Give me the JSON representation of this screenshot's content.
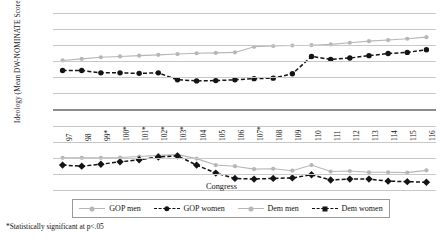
{
  "chart_data": {
    "type": "line",
    "title": "",
    "xlabel": "Congress",
    "ylabel": "Ideology (Mean DW-NOMINATE Score)",
    "ylim": [
      -0.5,
      0.6
    ],
    "yticks": [
      "0.6",
      "0.5",
      "0.4",
      "0.3",
      "0.2",
      "0.1",
      "0",
      "-0.1",
      "-0.2",
      "-0.3",
      "-0.4",
      "-0.5"
    ],
    "grid": true,
    "legend_position": "bottom",
    "categories": [
      "97",
      "98",
      "99*",
      "100*",
      "101*",
      "102*",
      "103*",
      "104",
      "105",
      "106",
      "107*",
      "108",
      "109",
      "110",
      "111",
      "112",
      "113",
      "114",
      "115",
      "116"
    ],
    "series": [
      {
        "name": "GOP men",
        "color": "#b6b6b6",
        "style": "solid",
        "marker": "circle",
        "values": [
          0.305,
          0.315,
          0.325,
          0.33,
          0.335,
          0.34,
          0.345,
          0.35,
          0.352,
          0.355,
          0.39,
          0.395,
          0.398,
          0.4,
          0.405,
          0.415,
          0.425,
          0.432,
          0.44,
          0.45
        ]
      },
      {
        "name": "GOP women",
        "color": "#141414",
        "style": "dashed",
        "marker": "circle",
        "values": [
          0.243,
          0.243,
          0.228,
          0.228,
          0.225,
          0.228,
          0.185,
          0.178,
          0.18,
          0.185,
          0.192,
          0.195,
          0.222,
          0.33,
          0.312,
          0.32,
          0.335,
          0.348,
          0.355,
          0.372
        ]
      },
      {
        "name": "Dem men",
        "color": "#b6b6b6",
        "style": "solid",
        "marker": "circle",
        "values": [
          -0.3,
          -0.3,
          -0.3,
          -0.298,
          -0.292,
          -0.285,
          -0.28,
          -0.305,
          -0.345,
          -0.352,
          -0.37,
          -0.368,
          -0.38,
          -0.345,
          -0.385,
          -0.382,
          -0.39,
          -0.39,
          -0.392,
          -0.378
        ]
      },
      {
        "name": "Dem women",
        "color": "#141414",
        "style": "dashed",
        "marker": "diamond",
        "values": [
          -0.345,
          -0.352,
          -0.34,
          -0.325,
          -0.312,
          -0.295,
          -0.288,
          -0.345,
          -0.395,
          -0.428,
          -0.432,
          -0.428,
          -0.425,
          -0.405,
          -0.438,
          -0.432,
          -0.432,
          -0.445,
          -0.448,
          -0.452
        ]
      }
    ]
  },
  "legend": {
    "items": [
      {
        "label": "GOP men"
      },
      {
        "label": "GOP women"
      },
      {
        "label": "Dem men"
      },
      {
        "label": "Dem women"
      }
    ]
  },
  "footnote": "*Statistically significant at p<.05"
}
